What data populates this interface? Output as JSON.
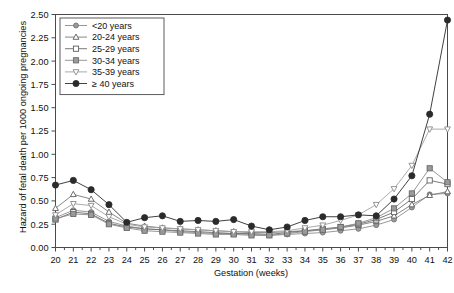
{
  "chart_data": {
    "type": "line",
    "title": "",
    "xlabel": "Gestation (weeks)",
    "ylabel": "Hazard of fetal death per 1000 ongoing pregnancies",
    "xlim": [
      20,
      42
    ],
    "ylim": [
      0.0,
      2.5
    ],
    "grid": false,
    "legend_position": "top-left",
    "x": [
      20,
      21,
      22,
      23,
      24,
      25,
      26,
      27,
      28,
      29,
      30,
      31,
      32,
      33,
      34,
      35,
      36,
      37,
      38,
      39,
      40,
      41,
      42
    ],
    "xticklabels": [
      "20",
      "21",
      "22",
      "23",
      "24",
      "25",
      "26",
      "27",
      "28",
      "29",
      "30",
      "31",
      "32",
      "33",
      "34",
      "35",
      "36",
      "37",
      "38",
      "39",
      "40",
      "41",
      "42"
    ],
    "yticklabels": [
      "0.00",
      "0.25",
      "0.50",
      "0.75",
      "1.00",
      "1.25",
      "1.50",
      "1.75",
      "2.00",
      "2.25",
      "2.50"
    ],
    "yticks": [
      0.0,
      0.25,
      0.5,
      0.75,
      1.0,
      1.25,
      1.5,
      1.75,
      2.0,
      2.25,
      2.5
    ],
    "series": [
      {
        "name": "<20 years",
        "marker": "filled-circle",
        "color": "#8c8c8c",
        "values": [
          0.32,
          0.4,
          0.38,
          0.28,
          0.23,
          0.2,
          0.19,
          0.17,
          0.16,
          0.15,
          0.15,
          0.14,
          0.13,
          0.14,
          0.15,
          0.16,
          0.18,
          0.2,
          0.24,
          0.3,
          0.43,
          0.57,
          0.58
        ]
      },
      {
        "name": "20-24 years",
        "marker": "open-triangle",
        "color": "#7a7a7a",
        "values": [
          0.42,
          0.57,
          0.52,
          0.38,
          0.26,
          0.23,
          0.21,
          0.2,
          0.19,
          0.18,
          0.17,
          0.16,
          0.16,
          0.17,
          0.18,
          0.19,
          0.21,
          0.24,
          0.28,
          0.34,
          0.46,
          0.56,
          0.6
        ]
      },
      {
        "name": "25-29 years",
        "marker": "open-square",
        "color": "#6e6e6e",
        "values": [
          0.3,
          0.38,
          0.36,
          0.26,
          0.22,
          0.2,
          0.19,
          0.18,
          0.17,
          0.16,
          0.15,
          0.15,
          0.14,
          0.16,
          0.18,
          0.2,
          0.22,
          0.25,
          0.3,
          0.38,
          0.52,
          0.72,
          0.68
        ]
      },
      {
        "name": "30-34 years",
        "marker": "filled-square",
        "color": "#8a8a8a",
        "values": [
          0.31,
          0.36,
          0.35,
          0.25,
          0.21,
          0.18,
          0.17,
          0.16,
          0.15,
          0.14,
          0.14,
          0.13,
          0.13,
          0.15,
          0.17,
          0.19,
          0.22,
          0.26,
          0.32,
          0.42,
          0.58,
          0.85,
          0.7
        ]
      },
      {
        "name": "35-39 years",
        "marker": "open-inverted-triangle",
        "color": "#a0a0a0",
        "values": [
          0.35,
          0.47,
          0.45,
          0.33,
          0.25,
          0.22,
          0.21,
          0.2,
          0.19,
          0.18,
          0.17,
          0.17,
          0.17,
          0.18,
          0.21,
          0.24,
          0.29,
          0.35,
          0.46,
          0.63,
          0.88,
          1.27,
          1.27
        ]
      },
      {
        "name": "≥ 40 years",
        "marker": "filled-black-circle",
        "color": "#2b2b2b",
        "values": [
          0.67,
          0.72,
          0.62,
          0.46,
          0.27,
          0.32,
          0.34,
          0.28,
          0.29,
          0.28,
          0.3,
          0.23,
          0.19,
          0.22,
          0.29,
          0.33,
          0.33,
          0.35,
          0.34,
          0.52,
          0.77,
          1.43,
          2.44
        ]
      }
    ],
    "note_week42_over40": 2.13
  },
  "axis": {
    "ylabel": "Hazard of fetal death per 1000 ongoing pregnancies",
    "xlabel": "Gestation (weeks)"
  },
  "caption": ""
}
